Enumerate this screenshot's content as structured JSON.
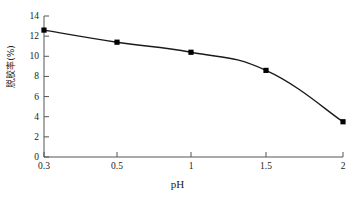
{
  "chart_data": {
    "type": "line",
    "title": "",
    "subtitle": "",
    "xlabel": "pH",
    "ylabel": "脱胶率(%)",
    "x_tick_labels": [
      "0.3",
      "0.5",
      "1",
      "1.5",
      "2"
    ],
    "y_tick_labels": [
      "0",
      "2",
      "4",
      "6",
      "8",
      "10",
      "12",
      "14"
    ],
    "x_values": [
      0.3,
      0.5,
      1,
      1.5,
      2
    ],
    "y_values": [
      12.6,
      11.4,
      10.4,
      8.6,
      3.5
    ],
    "categories": [
      "0.3",
      "0.5",
      "1",
      "1.5",
      "2"
    ],
    "values": [
      12.6,
      11.4,
      10.4,
      8.6,
      3.5
    ],
    "series": [
      {
        "name": "脱胶率",
        "values": [
          12.6,
          11.4,
          10.4,
          8.6,
          3.5
        ]
      }
    ],
    "ylim": [
      0,
      14
    ],
    "y_tick_step": 2,
    "grid": false,
    "legend": false,
    "legend_position": "none",
    "marker": "square",
    "line_color": "#1a1a1a",
    "marker_color": "#000000",
    "axis_color": "#4d4d4d",
    "x_axis_scale": "categorical",
    "annotations": []
  }
}
